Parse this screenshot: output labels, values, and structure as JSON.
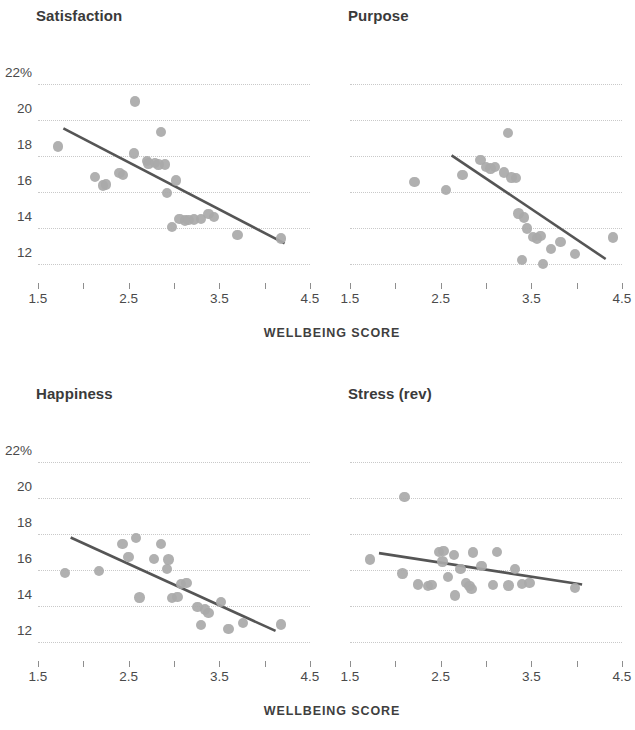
{
  "chart_data": {
    "type": "scatter",
    "title": "",
    "xlabel": "WELLBEING SCORE",
    "ylabel": "",
    "xlim": [
      1.5,
      4.5
    ],
    "ylim": [
      11.0,
      22.8
    ],
    "grid": true,
    "legend": "none",
    "xticks": [
      1.5,
      2.0,
      2.5,
      3.0,
      3.5,
      4.0,
      4.5
    ],
    "xtick_labels": [
      "1.5",
      "",
      "2.5",
      "",
      "3.5",
      "",
      "4.5"
    ],
    "yticks": [
      12,
      14,
      16,
      18,
      20,
      22
    ],
    "ytick_labels": [
      "12",
      "14",
      "16",
      "18",
      "20",
      "22%"
    ],
    "panels": [
      {
        "title": "Satisfaction",
        "points": [
          {
            "x": 1.72,
            "y": 18.55
          },
          {
            "x": 2.13,
            "y": 16.85
          },
          {
            "x": 2.22,
            "y": 16.38
          },
          {
            "x": 2.25,
            "y": 16.42
          },
          {
            "x": 2.4,
            "y": 17.05
          },
          {
            "x": 2.44,
            "y": 16.95
          },
          {
            "x": 2.57,
            "y": 21.05
          },
          {
            "x": 2.56,
            "y": 18.15
          },
          {
            "x": 2.7,
            "y": 17.75
          },
          {
            "x": 2.72,
            "y": 17.6
          },
          {
            "x": 2.79,
            "y": 17.62
          },
          {
            "x": 2.83,
            "y": 17.55
          },
          {
            "x": 2.86,
            "y": 19.35
          },
          {
            "x": 2.9,
            "y": 17.55
          },
          {
            "x": 2.92,
            "y": 15.95
          },
          {
            "x": 2.98,
            "y": 14.05
          },
          {
            "x": 3.02,
            "y": 16.65
          },
          {
            "x": 3.06,
            "y": 14.5
          },
          {
            "x": 3.12,
            "y": 14.42
          },
          {
            "x": 3.16,
            "y": 14.45
          },
          {
            "x": 3.22,
            "y": 14.48
          },
          {
            "x": 3.3,
            "y": 14.52
          },
          {
            "x": 3.38,
            "y": 14.78
          },
          {
            "x": 3.44,
            "y": 14.62
          },
          {
            "x": 3.7,
            "y": 13.62
          },
          {
            "x": 4.18,
            "y": 13.42
          }
        ],
        "trend": {
          "x1": 1.78,
          "y1": 19.55,
          "x2": 4.22,
          "y2": 13.15
        }
      },
      {
        "title": "Purpose",
        "points": [
          {
            "x": 2.21,
            "y": 16.55
          },
          {
            "x": 2.56,
            "y": 16.12
          },
          {
            "x": 2.74,
            "y": 16.95
          },
          {
            "x": 2.94,
            "y": 17.78
          },
          {
            "x": 3.0,
            "y": 17.4
          },
          {
            "x": 3.05,
            "y": 17.32
          },
          {
            "x": 3.1,
            "y": 17.4
          },
          {
            "x": 3.2,
            "y": 17.1
          },
          {
            "x": 3.24,
            "y": 19.28
          },
          {
            "x": 3.28,
            "y": 16.82
          },
          {
            "x": 3.33,
            "y": 16.78
          },
          {
            "x": 3.36,
            "y": 14.82
          },
          {
            "x": 3.42,
            "y": 14.6
          },
          {
            "x": 3.45,
            "y": 13.98
          },
          {
            "x": 3.4,
            "y": 12.22
          },
          {
            "x": 3.52,
            "y": 13.52
          },
          {
            "x": 3.56,
            "y": 13.42
          },
          {
            "x": 3.6,
            "y": 13.55
          },
          {
            "x": 3.63,
            "y": 12.0
          },
          {
            "x": 3.72,
            "y": 12.82
          },
          {
            "x": 3.82,
            "y": 13.22
          },
          {
            "x": 3.98,
            "y": 12.55
          },
          {
            "x": 4.4,
            "y": 13.48
          }
        ],
        "trend": {
          "x1": 2.62,
          "y1": 18.05,
          "x2": 4.32,
          "y2": 12.28
        }
      },
      {
        "title": "Happiness",
        "points": [
          {
            "x": 1.8,
            "y": 15.85
          },
          {
            "x": 2.17,
            "y": 15.95
          },
          {
            "x": 2.43,
            "y": 17.45
          },
          {
            "x": 2.5,
            "y": 16.72
          },
          {
            "x": 2.58,
            "y": 17.8
          },
          {
            "x": 2.62,
            "y": 14.48
          },
          {
            "x": 2.78,
            "y": 16.62
          },
          {
            "x": 2.86,
            "y": 17.45
          },
          {
            "x": 2.94,
            "y": 16.6
          },
          {
            "x": 2.92,
            "y": 16.05
          },
          {
            "x": 2.98,
            "y": 14.45
          },
          {
            "x": 3.04,
            "y": 14.52
          },
          {
            "x": 3.08,
            "y": 15.22
          },
          {
            "x": 3.14,
            "y": 15.28
          },
          {
            "x": 3.26,
            "y": 13.95
          },
          {
            "x": 3.3,
            "y": 12.95
          },
          {
            "x": 3.34,
            "y": 13.82
          },
          {
            "x": 3.38,
            "y": 13.62
          },
          {
            "x": 3.52,
            "y": 14.22
          },
          {
            "x": 3.6,
            "y": 12.72
          },
          {
            "x": 3.76,
            "y": 13.05
          },
          {
            "x": 4.18,
            "y": 12.98
          }
        ],
        "trend": {
          "x1": 1.86,
          "y1": 17.82,
          "x2": 4.12,
          "y2": 12.62
        }
      },
      {
        "title": "Stress (rev)",
        "points": [
          {
            "x": 1.72,
            "y": 16.6
          },
          {
            "x": 2.08,
            "y": 15.82
          },
          {
            "x": 2.1,
            "y": 20.08
          },
          {
            "x": 2.25,
            "y": 15.2
          },
          {
            "x": 2.36,
            "y": 15.12
          },
          {
            "x": 2.4,
            "y": 15.18
          },
          {
            "x": 2.48,
            "y": 17.02
          },
          {
            "x": 2.53,
            "y": 17.05
          },
          {
            "x": 2.52,
            "y": 16.48
          },
          {
            "x": 2.58,
            "y": 15.62
          },
          {
            "x": 2.65,
            "y": 16.85
          },
          {
            "x": 2.66,
            "y": 14.58
          },
          {
            "x": 2.72,
            "y": 16.05
          },
          {
            "x": 2.78,
            "y": 15.28
          },
          {
            "x": 2.82,
            "y": 15.12
          },
          {
            "x": 2.84,
            "y": 14.95
          },
          {
            "x": 2.86,
            "y": 16.98
          },
          {
            "x": 2.95,
            "y": 16.22
          },
          {
            "x": 3.08,
            "y": 15.18
          },
          {
            "x": 3.12,
            "y": 17.02
          },
          {
            "x": 3.25,
            "y": 15.15
          },
          {
            "x": 3.32,
            "y": 16.08
          },
          {
            "x": 3.4,
            "y": 15.22
          },
          {
            "x": 3.48,
            "y": 15.28
          },
          {
            "x": 3.98,
            "y": 15.02
          }
        ],
        "trend": {
          "x1": 1.82,
          "y1": 16.95,
          "x2": 4.06,
          "y2": 15.2
        }
      }
    ]
  },
  "panels": {
    "satisfaction": {
      "title": "Satisfaction"
    },
    "purpose": {
      "title": "Purpose"
    },
    "happiness": {
      "title": "Happiness"
    },
    "stress": {
      "title": "Stress (rev)"
    }
  },
  "axis": {
    "x_caption_top": "WELLBEING SCORE",
    "x_caption_bottom": "WELLBEING SCORE"
  },
  "colors": {
    "dot": "#a9a9a9",
    "trend": "#555555",
    "grid": "#c9c9c9",
    "text": "#3a3a3a",
    "background": "#ffffff"
  }
}
